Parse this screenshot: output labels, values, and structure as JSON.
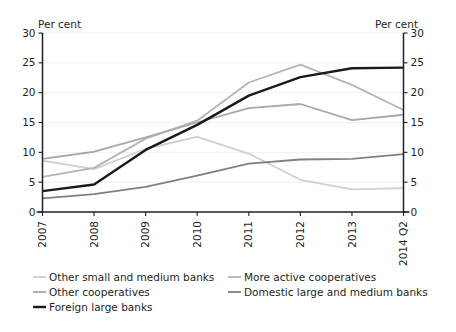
{
  "axis": {
    "left_unit_label": "Per cent",
    "right_unit_label": "Per cent",
    "y_ticks": [
      "0",
      "5",
      "10",
      "15",
      "20",
      "25",
      "30"
    ],
    "x_ticks": [
      "2007",
      "2008",
      "2009",
      "2010",
      "2011",
      "2012",
      "2013",
      "2014 Q2"
    ]
  },
  "legend": {
    "items": [
      {
        "label": "Other small and medium banks",
        "color": "#cfcfcf",
        "swatch_name": "legend-swatch-other-small-and-medium-banks"
      },
      {
        "label": "More active cooperatives",
        "color": "#b5b5b5",
        "swatch_name": "legend-swatch-more-active-cooperatives"
      },
      {
        "label": "Other cooperatives",
        "color": "#a8a8a8",
        "swatch_name": "legend-swatch-other-cooperatives"
      },
      {
        "label": "Domestic large and medium banks",
        "color": "#808080",
        "swatch_name": "legend-swatch-domestic-large-and-medium-banks"
      },
      {
        "label": "Foreign large banks",
        "color": "#1a1a1a",
        "swatch_name": "legend-swatch-foreign-large-banks"
      }
    ]
  },
  "chart_data": {
    "type": "line",
    "title": "",
    "xlabel": "",
    "ylabel": "Per cent",
    "ylim": [
      0,
      30
    ],
    "ytick_step": 5,
    "grid": true,
    "legend_position": "bottom",
    "categories": [
      "2007",
      "2008",
      "2009",
      "2010",
      "2011",
      "2012",
      "2013",
      "2014 Q2"
    ],
    "series": [
      {
        "name": "Other small and medium banks",
        "color": "#cfcfcf",
        "width": 1.8,
        "values": [
          8.6,
          7.2,
          10.6,
          12.6,
          9.8,
          5.4,
          3.8,
          4.0
        ]
      },
      {
        "name": "More active cooperatives",
        "color": "#b5b5b5",
        "width": 1.8,
        "values": [
          5.9,
          7.4,
          12.3,
          15.3,
          21.7,
          24.7,
          21.3,
          17.1
        ]
      },
      {
        "name": "Other cooperatives",
        "color": "#a8a8a8",
        "width": 1.8,
        "values": [
          8.9,
          10.1,
          12.5,
          15.0,
          17.4,
          18.1,
          15.4,
          16.3
        ]
      },
      {
        "name": "Domestic large and medium banks",
        "color": "#808080",
        "width": 1.8,
        "values": [
          2.3,
          3.0,
          4.2,
          6.1,
          8.1,
          8.8,
          8.9,
          9.7
        ]
      },
      {
        "name": "Foreign large banks",
        "color": "#1a1a1a",
        "width": 2.4,
        "values": [
          3.5,
          4.6,
          10.4,
          14.6,
          19.5,
          22.6,
          24.1,
          24.2
        ]
      }
    ]
  }
}
